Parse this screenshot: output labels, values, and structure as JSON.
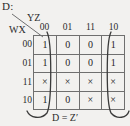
{
  "figure": {
    "output_label": "D:",
    "column_variables": "YZ",
    "row_variables": "WX",
    "column_headers": [
      "00",
      "01",
      "11",
      "10"
    ],
    "row_headers": [
      "00",
      "01",
      "11",
      "10"
    ],
    "cells": [
      [
        "1",
        "0",
        "0",
        "1"
      ],
      [
        "1",
        "0",
        "0",
        "1"
      ],
      [
        "×",
        "×",
        "×",
        "×"
      ],
      [
        "1",
        "0",
        "×",
        "×"
      ]
    ],
    "expression": "D = Z′",
    "colors": {
      "background": "#f2f1ef",
      "grid_line": "#6f6f6f",
      "text": "#2b2b2b",
      "group_loop": "#3a3a3a"
    },
    "groups": [
      {
        "name": "column-00-loop",
        "columns": [
          "00"
        ],
        "wraparound": true
      },
      {
        "name": "column-10-loop",
        "columns": [
          "10"
        ],
        "wraparound": true
      }
    ]
  }
}
